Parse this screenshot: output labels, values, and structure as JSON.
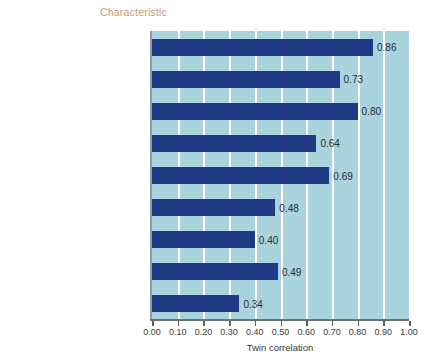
{
  "chart_data": {
    "type": "bar",
    "orientation": "horizontal",
    "title": "Characteristic",
    "xlabel": "Twin correlation",
    "ylabel": "",
    "xlim": [
      0.0,
      1.0
    ],
    "grid": true,
    "legend": "none",
    "categories": [
      "Height",
      "Weight",
      "Alpha activity in brain",
      "Systolic blood pressure",
      "IQ score",
      "Personality traits",
      "Occupational interests",
      "Religiosity",
      "Nonreligious social attitudes"
    ],
    "values": [
      0.86,
      0.73,
      0.8,
      0.64,
      0.69,
      0.48,
      0.4,
      0.49,
      0.34
    ],
    "value_labels": [
      "0.86",
      "0.73",
      "0.80",
      "0.64",
      "0.69",
      "0.48",
      "0.40",
      "0.49",
      "0.34"
    ],
    "xticks": [
      0.0,
      0.1,
      0.2,
      0.3,
      0.4,
      0.5,
      0.6,
      0.7,
      0.8,
      0.9,
      1.0
    ],
    "xticklabels": [
      "0.00",
      "0.10",
      "0.20",
      "0.30",
      "0.40",
      "0.50",
      "0.60",
      "0.70",
      "0.80",
      "0.90",
      "1.00"
    ],
    "colors": {
      "bar": "#1e3a82",
      "plot_background": "#a9d3dd",
      "gridline": "#ffffff",
      "title_text": "#c49a6c",
      "category_text": "#5a5a66",
      "value_text": "#2b2b33",
      "axis_line": "#6f6f6f",
      "page_background": "#ffffff"
    }
  }
}
